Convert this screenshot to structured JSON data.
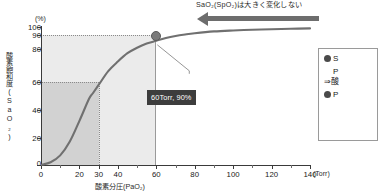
{
  "annotation": {
    "top_note": "SaO₂(SpO₂)は大きく変化しない",
    "arrow_icon": "left-arrow-icon"
  },
  "callout": {
    "label": "60Torr, 90%"
  },
  "legend": {
    "items": [
      {
        "bullet": "●",
        "line1": "S",
        "line2": "P"
      },
      {
        "arrow": "⇒酸"
      },
      {
        "bullet": "●",
        "line1": "P"
      }
    ]
  },
  "chart_data": {
    "type": "line",
    "title": "",
    "xlabel": "酸素分圧(PaO₂)",
    "ylabel": "酸素飽和度(SaO₂)",
    "x_unit": "(Torr)",
    "y_unit": "(%)",
    "xlim": [
      0,
      140
    ],
    "ylim": [
      0,
      100
    ],
    "grid": false,
    "xticks": [
      0,
      20,
      30,
      40,
      60,
      80,
      100,
      120,
      140
    ],
    "xtick_labels": [
      "0",
      "20",
      "30",
      "40",
      "60",
      "80",
      "100",
      "120",
      "140"
    ],
    "x_minor_ticks": [
      10,
      50,
      70,
      90,
      110,
      130
    ],
    "yticks": [
      0,
      20,
      40,
      60,
      80,
      90,
      100
    ],
    "ytick_labels": [
      "0",
      "20",
      "40",
      "60",
      "80",
      "90",
      "100"
    ],
    "series": [
      {
        "name": "酸素解離曲線",
        "x": [
          0,
          5,
          10,
          15,
          20,
          25,
          27,
          30,
          35,
          40,
          45,
          50,
          55,
          60,
          65,
          70,
          75,
          80,
          90,
          100,
          110,
          120,
          130,
          140
        ],
        "values": [
          0,
          2,
          7,
          17,
          32,
          48,
          52,
          58,
          68,
          75,
          81,
          85,
          88,
          90,
          92,
          93.5,
          94.6,
          95.5,
          96.8,
          97.5,
          98,
          98.4,
          98.7,
          99
        ]
      }
    ],
    "annotations": [
      {
        "name": "data-point-60-90",
        "x": 60,
        "y": 90,
        "label": "60Torr, 90%"
      },
      {
        "name": "guide-90-percent",
        "type": "hline",
        "y": 90,
        "x_to": 60
      },
      {
        "name": "guide-60-percent",
        "type": "hline",
        "y": 60,
        "x_to": 30
      },
      {
        "name": "guide-60-torr",
        "type": "vline",
        "x": 60,
        "y_to": 90
      },
      {
        "name": "guide-30-torr",
        "type": "vline",
        "x": 30,
        "y_to": 60
      }
    ],
    "regions": [
      {
        "name": "light-shaded-region",
        "x_range": [
          0,
          60
        ],
        "y_range": [
          0,
          90
        ],
        "color": "#ebebeb"
      },
      {
        "name": "dark-shaded-region",
        "x_range": [
          0,
          30
        ],
        "y_range": [
          0,
          60
        ],
        "color": "#d2d2d2"
      }
    ],
    "colors": {
      "curve": "#707070",
      "marker": "#7a7a7a",
      "arrow": "#6d6d6d",
      "callout_bg": "#3d3d3d",
      "callout_text": "#ffffff"
    }
  }
}
